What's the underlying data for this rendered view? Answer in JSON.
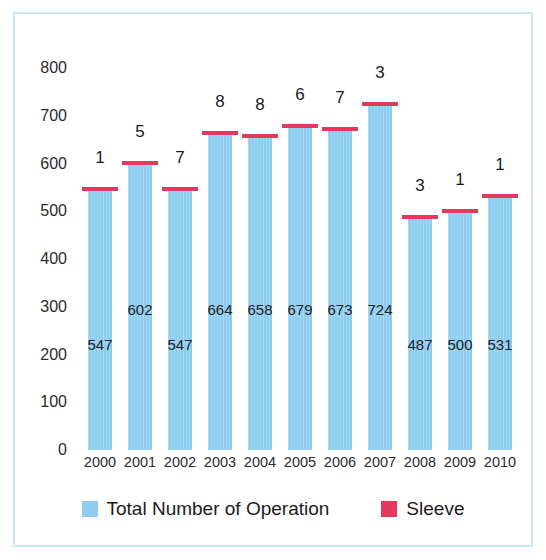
{
  "chart_data": {
    "type": "bar",
    "title": "",
    "xlabel": "",
    "ylabel": "",
    "ylim": [
      0,
      800
    ],
    "ytick_step": 100,
    "grid": false,
    "legend_position": "bottom",
    "categories": [
      "2000",
      "2001",
      "2002",
      "2003",
      "2004",
      "2005",
      "2006",
      "2007",
      "2008",
      "2009",
      "2010"
    ],
    "yticks": [
      "800",
      "700",
      "600",
      "500",
      "400",
      "300",
      "200",
      "100",
      "0"
    ],
    "series": [
      {
        "name": "Total Number of Operation",
        "color": "#8ccdf0",
        "type": "bar",
        "values": [
          547,
          602,
          547,
          664,
          658,
          679,
          673,
          724,
          487,
          500,
          531
        ],
        "value_labels": [
          "547",
          "602",
          "547",
          "664",
          "658",
          "679",
          "673",
          "724",
          "487",
          "500",
          "531"
        ]
      },
      {
        "name": "Sleeve",
        "color": "#e23a5e",
        "type": "marker",
        "values": [
          1,
          5,
          7,
          8,
          8,
          6,
          7,
          3,
          3,
          1,
          1
        ],
        "value_labels": [
          "1",
          "5",
          "7",
          "8",
          "8",
          "6",
          "7",
          "3",
          "3",
          "1",
          "1"
        ]
      }
    ]
  },
  "legend": {
    "items": [
      {
        "label": "Total Number of Operation",
        "color": "#8ccdf0",
        "icon": "square-swatch"
      },
      {
        "label": "Sleeve",
        "color": "#e23a5e",
        "icon": "square-swatch"
      }
    ]
  },
  "frame": {
    "border_color": "#cfe6f5",
    "background": "#ffffff"
  }
}
